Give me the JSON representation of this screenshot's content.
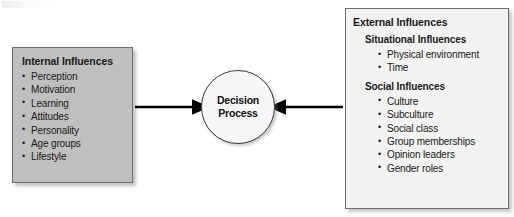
{
  "diagram": {
    "type": "influence-flow",
    "background_color": "#ffffff",
    "center": {
      "label_line1": "Decision",
      "label_line2": "Process",
      "shape": "circle",
      "fill_color": "#f7f7f7",
      "border_color": "#3a3a3a"
    },
    "internal": {
      "heading": "Internal Influences",
      "fill_color": "#bfbfbf",
      "border_color": "#6e6e6e",
      "items": [
        "Perception",
        "Motivation",
        "Learning",
        "Attitudes",
        "Personality",
        "Age groups",
        "Lifestyle"
      ]
    },
    "external": {
      "heading": "External Influences",
      "fill_color": "#f2f2f0",
      "border_color": "#6e6e6e",
      "sections": [
        {
          "heading": "Situational Influences",
          "items": [
            "Physical environment",
            "Time"
          ]
        },
        {
          "heading": "Social Influences",
          "items": [
            "Culture",
            "Subculture",
            "Social class",
            "Group memberships",
            "Opinion leaders",
            "Gender roles"
          ]
        }
      ]
    },
    "arrows": [
      {
        "name": "internal-to-decision",
        "direction": "right",
        "color": "#000000"
      },
      {
        "name": "external-to-decision",
        "direction": "left",
        "color": "#000000"
      }
    ]
  }
}
